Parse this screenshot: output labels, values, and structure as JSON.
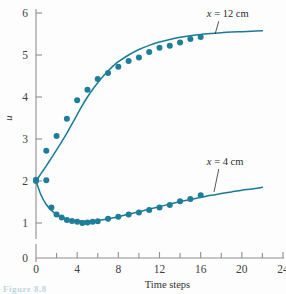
{
  "figure": {
    "caption_fragment": "Figure 8.8"
  },
  "chart_data": {
    "type": "scatter",
    "title": "",
    "xlabel": "Time steps",
    "ylabel": "u",
    "xlim": [
      0,
      24
    ],
    "ylim": [
      0,
      6
    ],
    "grid": false,
    "legend_position": "inline-annotations",
    "x_ticks": [
      0,
      4,
      8,
      12,
      16,
      20,
      24
    ],
    "x_tick_labels": [
      "0",
      "4",
      "8",
      "12",
      "16",
      "20",
      "24"
    ],
    "x_minor_ticks": [
      2,
      6,
      10,
      14,
      18,
      22
    ],
    "y_ticks": [
      0,
      1,
      2,
      3,
      4,
      5,
      6
    ],
    "y_tick_labels": [
      "0",
      "1",
      "2",
      "3",
      "4",
      "5",
      "6"
    ],
    "y_axis_break": true,
    "y_axis_break_note": "0 tick is offset below 1; plotting region spans u = 1 to 6",
    "colors": {
      "curve": "#1a7a96",
      "marker": "#1f7d9c",
      "axis": "#8e8e8e",
      "text": "#333333"
    },
    "series": [
      {
        "name": "x = 12 cm",
        "label_math": "x",
        "label_rest": " = 12 cm",
        "style": "analytical-curve-with-data-markers",
        "curve": {
          "x": [
            0.0,
            0.5,
            1.0,
            1.5,
            2.0,
            2.5,
            3.0,
            3.5,
            4.0,
            4.5,
            5.0,
            5.5,
            6.0,
            6.5,
            7.0,
            7.5,
            8.0,
            9.0,
            10.0,
            11.0,
            12.0,
            13.0,
            14.0,
            15.0,
            16.0,
            17.0,
            18.0,
            19.0,
            20.0,
            21.0,
            22.0
          ],
          "y": [
            2.0,
            2.18,
            2.36,
            2.55,
            2.74,
            2.94,
            3.14,
            3.36,
            3.58,
            3.8,
            4.0,
            4.18,
            4.34,
            4.49,
            4.62,
            4.74,
            4.84,
            5.0,
            5.13,
            5.23,
            5.31,
            5.37,
            5.42,
            5.46,
            5.49,
            5.51,
            5.53,
            5.545,
            5.555,
            5.565,
            5.575
          ]
        },
        "points": {
          "x": [
            0.0,
            1.0,
            2.0,
            3.0,
            4.0,
            5.0,
            6.0,
            7.0,
            8.0,
            9.0,
            10.0,
            11.0,
            12.0,
            13.0,
            14.0,
            15.0,
            16.0
          ],
          "y": [
            2.03,
            2.72,
            3.07,
            3.48,
            3.92,
            4.17,
            4.43,
            4.57,
            4.72,
            4.86,
            4.94,
            5.07,
            5.17,
            5.22,
            5.3,
            5.38,
            5.43
          ]
        }
      },
      {
        "name": "x = 4 cm",
        "label_math": "x",
        "label_rest": " = 4 cm",
        "style": "analytical-curve-with-data-markers",
        "curve": {
          "x": [
            0.0,
            0.5,
            1.0,
            1.5,
            2.0,
            2.5,
            3.0,
            3.5,
            4.0,
            4.5,
            5.0,
            5.5,
            6.0,
            6.5,
            7.0,
            8.0,
            9.0,
            10.0,
            11.0,
            12.0,
            13.0,
            14.0,
            15.0,
            16.0,
            17.0,
            18.0,
            19.0,
            20.0,
            21.0,
            22.0
          ],
          "y": [
            2.0,
            1.66,
            1.44,
            1.3,
            1.2,
            1.13,
            1.09,
            1.06,
            1.05,
            1.045,
            1.045,
            1.05,
            1.06,
            1.08,
            1.1,
            1.15,
            1.21,
            1.27,
            1.33,
            1.39,
            1.45,
            1.51,
            1.56,
            1.61,
            1.66,
            1.7,
            1.74,
            1.78,
            1.81,
            1.85
          ]
        },
        "points": {
          "x": [
            0.0,
            1.0,
            1.5,
            2.0,
            2.5,
            3.0,
            3.5,
            4.0,
            4.5,
            5.0,
            5.5,
            6.0,
            7.0,
            8.0,
            9.0,
            10.0,
            11.0,
            12.0,
            13.0,
            14.0,
            15.0,
            16.0
          ],
          "y": [
            2.0,
            2.02,
            1.37,
            1.2,
            1.13,
            1.07,
            1.05,
            1.03,
            1.0,
            1.01,
            1.03,
            1.04,
            1.1,
            1.15,
            1.2,
            1.25,
            1.31,
            1.37,
            1.43,
            1.52,
            1.57,
            1.66
          ]
        }
      }
    ],
    "annotations": [
      {
        "text": "x = 12 cm",
        "x": 16.6,
        "y": 5.9,
        "leader_to": {
          "x": 17.4,
          "y": 5.5
        }
      },
      {
        "text": "x = 4 cm",
        "x": 16.6,
        "y": 2.38,
        "leader_to": {
          "x": 17.3,
          "y": 1.74
        }
      }
    ]
  }
}
